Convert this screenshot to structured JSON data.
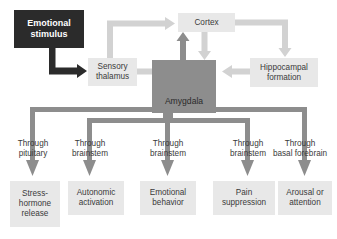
{
  "diagram": {
    "type": "flow-diagram",
    "colors": {
      "background": "#ffffff",
      "box_light": "#e8e8e8",
      "box_mid": "#8d8d8d",
      "box_dark": "#2b2b2b",
      "arrow_light": "#d2d2d2",
      "arrow_mid": "#8d8d8d",
      "arrow_dark": "#2b2b2b",
      "text_dark": "#3a3a3a",
      "text_light": "#ffffff"
    },
    "nodes": {
      "stimulus": {
        "label": "Emotional stimulus",
        "line1": "Emotional",
        "line2": "stimulus",
        "style": "dark"
      },
      "thalamus": {
        "label": "Sensory thalamus",
        "line1": "Sensory",
        "line2": "thalamus",
        "style": "light"
      },
      "cortex": {
        "label": "Cortex",
        "line1": "Cortex",
        "line2": "",
        "style": "light"
      },
      "hippocampus": {
        "label": "Hippocampal formation",
        "line1": "Hippocampal",
        "line2": "formation",
        "style": "light"
      },
      "amygdala": {
        "label": "Amygdala",
        "line1": "Amygdala",
        "line2": "",
        "style": "mid"
      }
    },
    "pathway_labels": [
      {
        "line1": "Through",
        "line2": "pituitary"
      },
      {
        "line1": "Through",
        "line2": "brainstem"
      },
      {
        "line1": "Through",
        "line2": "brainstem"
      },
      {
        "line1": "Through",
        "line2": "brainstem"
      },
      {
        "line1": "Through",
        "line2": "basal forebrain"
      }
    ],
    "outputs": [
      {
        "line1": "Stress-",
        "line2": "hormone",
        "line3": "release"
      },
      {
        "line1": "Autonomic",
        "line2": "activation",
        "line3": ""
      },
      {
        "line1": "Emotional",
        "line2": "behavior",
        "line3": ""
      },
      {
        "line1": "Pain",
        "line2": "suppression",
        "line3": ""
      },
      {
        "line1": "Arousal or",
        "line2": "attention",
        "line3": ""
      }
    ],
    "connections": [
      {
        "from": "stimulus",
        "to": "thalamus",
        "style": "dark"
      },
      {
        "from": "thalamus",
        "to": "cortex",
        "style": "light"
      },
      {
        "from": "thalamus",
        "to": "amygdala",
        "style": "light"
      },
      {
        "from": "cortex",
        "to": "amygdala",
        "style": "light"
      },
      {
        "from": "amygdala",
        "to": "cortex",
        "style": "mid"
      },
      {
        "from": "cortex",
        "to": "hippocampus",
        "style": "light"
      },
      {
        "from": "hippocampus",
        "to": "amygdala",
        "style": "light"
      },
      {
        "from": "amygdala",
        "to": "outputs",
        "style": "mid"
      }
    ]
  }
}
